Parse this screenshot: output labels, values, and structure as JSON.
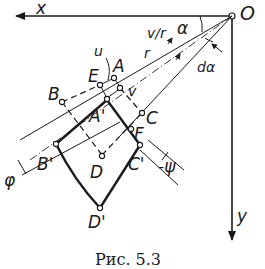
{
  "figure": {
    "axes": {
      "x_label": "x",
      "y_label": "y",
      "origin_label": "O"
    },
    "points": {
      "A": "A",
      "B": "B",
      "C": "C",
      "D": "D",
      "E": "E",
      "F": "F",
      "A_prime": "A'",
      "B_prime": "B'",
      "C_prime": "C'",
      "D_prime": "D'"
    },
    "symbols": {
      "alpha": "α",
      "d_alpha": "dα",
      "r": "r",
      "v_over_r": "v/r",
      "u": "u",
      "v": "v",
      "phi": "φ",
      "psi": "-ψ"
    },
    "caption": "Рис. 5.3"
  },
  "colors": {
    "ink": "#1a1a1a",
    "background": "#ffffff"
  }
}
